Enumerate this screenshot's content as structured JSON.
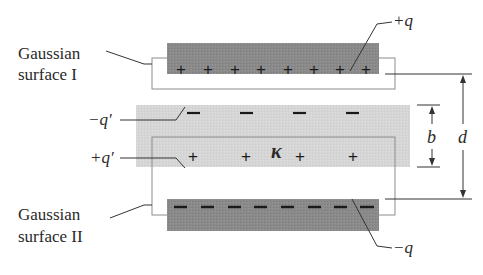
{
  "labels": {
    "gaussian_surface_1_line1": "Gaussian",
    "gaussian_surface_1_line2": "surface I",
    "gaussian_surface_2_line1": "Gaussian",
    "gaussian_surface_2_line2": "surface II",
    "plus_q": "+q",
    "minus_q": "−q",
    "minus_q_prime": "−q′",
    "plus_q_prime": "+q′",
    "kappa": "κ",
    "b": "b",
    "d": "d"
  },
  "signs": {
    "top_plate": [
      "+",
      "+",
      "+",
      "+",
      "+",
      "+",
      "+",
      "+"
    ],
    "bottom_plate": [
      "–",
      "–",
      "–",
      "–",
      "–",
      "–",
      "–",
      "–"
    ],
    "dielectric_top": [
      "–",
      "–",
      "–",
      "–"
    ],
    "dielectric_bottom": [
      "+",
      "+",
      "+",
      "+"
    ]
  },
  "colors": {
    "plate": "#8a8a8a",
    "dielectric": "#d6d6d6",
    "outline": "#8c8c8c",
    "line": "#333333"
  }
}
